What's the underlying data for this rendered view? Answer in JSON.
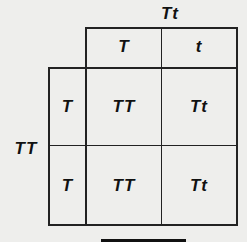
{
  "punnett_square": {
    "top_parent": "Tt",
    "left_parent": "TT",
    "column_headers": [
      "T",
      "t"
    ],
    "row_headers": [
      "T",
      "T"
    ],
    "cells": [
      [
        "TT",
        "Tt"
      ],
      [
        "TT",
        "Tt"
      ]
    ]
  }
}
